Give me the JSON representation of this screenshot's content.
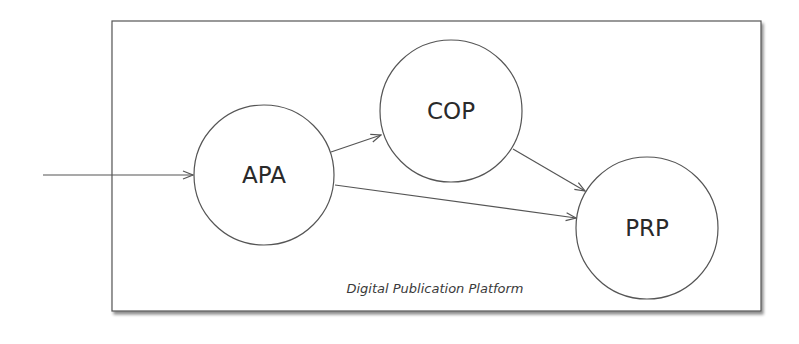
{
  "diagram": {
    "container": {
      "label": "Digital Publication Platform",
      "x": 112,
      "y": 21,
      "width": 649,
      "height": 290,
      "stroke": "#555555",
      "shadow": "#9a9a9a"
    },
    "nodes": [
      {
        "id": "APA",
        "label": "APA",
        "cx": 264,
        "cy": 175,
        "r": 70
      },
      {
        "id": "COP",
        "label": "COP",
        "cx": 451,
        "cy": 111,
        "r": 71
      },
      {
        "id": "PRP",
        "label": "PRP",
        "cx": 647,
        "cy": 228,
        "r": 71
      }
    ],
    "edges": [
      {
        "from": "external",
        "to": "APA",
        "x1": 43,
        "y1": 175,
        "x2": 193,
        "y2": 175
      },
      {
        "from": "APA",
        "to": "COP",
        "x1": 331,
        "y1": 152,
        "x2": 381,
        "y2": 135
      },
      {
        "from": "COP",
        "to": "PRP",
        "x1": 513,
        "y1": 149,
        "x2": 585,
        "y2": 191
      },
      {
        "from": "APA",
        "to": "PRP",
        "x1": 335,
        "y1": 185,
        "x2": 576,
        "y2": 218
      }
    ],
    "line_color": "#555555"
  }
}
